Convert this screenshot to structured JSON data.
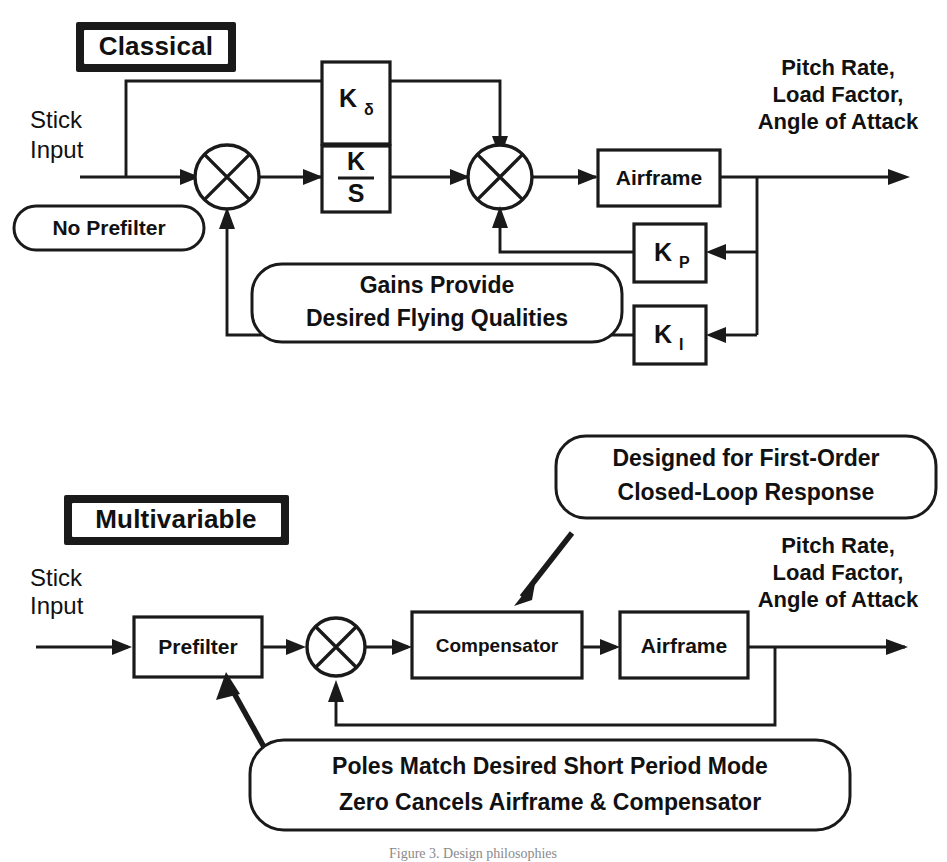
{
  "figure": {
    "caption": "Figure 3.   Design philosophies"
  },
  "classical": {
    "header": "Classical",
    "input_line1": "Stick",
    "input_line2": "Input",
    "prefilter_note": "No Prefilter",
    "gain_feedforward": "K",
    "gain_feedforward_sub": "δ",
    "gain_integral_num": "K",
    "gain_integral_den": "S",
    "plant": "Airframe",
    "gain_p": "K",
    "gain_p_sub": "P",
    "gain_i": "K",
    "gain_i_sub": "I",
    "output_line1": "Pitch Rate,",
    "output_line2": "Load Factor,",
    "output_line3": "Angle of Attack",
    "callout_line1": "Gains Provide",
    "callout_line2": "Desired Flying Qualities"
  },
  "multivariable": {
    "header": "Multivariable",
    "input_line1": "Stick",
    "input_line2": "Input",
    "prefilter": "Prefilter",
    "compensator": "Compensator",
    "plant": "Airframe",
    "output_line1": "Pitch Rate,",
    "output_line2": "Load Factor,",
    "output_line3": "Angle of Attack",
    "callout_top_line1": "Designed for First-Order",
    "callout_top_line2": "Closed-Loop Response",
    "callout_bottom_line1": "Poles Match Desired Short Period Mode",
    "callout_bottom_line2": "Zero Cancels Airframe & Compensator"
  },
  "colors": {
    "ink": "#1a1a1a",
    "paper": "#ffffff"
  }
}
